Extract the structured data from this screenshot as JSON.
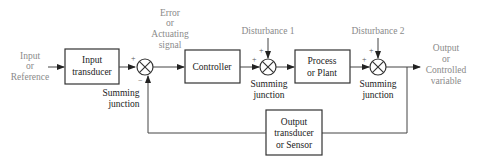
{
  "diagram": {
    "input_label": [
      "Input",
      "or",
      "Reference"
    ],
    "error_label": [
      "Error",
      "or",
      "Actuating",
      "signal"
    ],
    "output_label": [
      "Output",
      "or",
      "Controlled",
      "variable"
    ],
    "blocks": {
      "input_transducer": [
        "Input",
        "transducer"
      ],
      "controller": [
        "Controller"
      ],
      "plant": [
        "Process",
        "or Plant"
      ],
      "sensor": [
        "Output",
        "transducer",
        "or Sensor"
      ]
    },
    "disturbances": {
      "d1": "Disturbance 1",
      "d2": "Disturbance 2"
    },
    "summing_junctions": [
      {
        "label": [
          "Summing",
          "junction"
        ],
        "signs": [
          "+",
          "−"
        ]
      },
      {
        "label": [
          "Summing",
          "junction"
        ],
        "signs": [
          "+",
          "+"
        ]
      },
      {
        "label": [
          "Summing",
          "junction"
        ],
        "signs": [
          "+",
          "+"
        ]
      }
    ],
    "colors": {
      "external_label": "#8a8a8a",
      "block_text": "#222222",
      "line": "#444444"
    }
  }
}
